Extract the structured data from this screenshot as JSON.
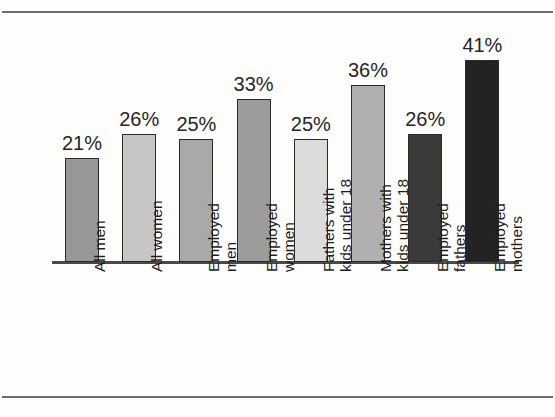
{
  "figure": {
    "background_color": "#fdfdfc",
    "rule_color": "#6d6d6d",
    "axis_color": "#4a4a4a"
  },
  "chart_data": {
    "type": "bar",
    "title": "",
    "subtitle": "",
    "xlabel": "",
    "ylabel": "",
    "ylim": [
      0,
      45
    ],
    "grid": false,
    "legend": "none",
    "value_suffix": "%",
    "categories": [
      "All men",
      "All women",
      "Employed men",
      "Employed women",
      "Fathers with kids under 18",
      "Mothers with kids under 18",
      "Employed fathers",
      "Employed mothers"
    ],
    "values": [
      21,
      26,
      25,
      33,
      25,
      36,
      26,
      41
    ],
    "data_labels": [
      "21%",
      "26%",
      "25%",
      "33%",
      "25%",
      "36%",
      "26%",
      "41%"
    ],
    "bar_colors": [
      "#989898",
      "#c6c6c6",
      "#a9a9a9",
      "#9c9c9c",
      "#dcdcdc",
      "#b0b0b0",
      "#3a3a3a",
      "#232323"
    ],
    "bar_edge_color": "#2a2a2a",
    "tick_labels": [
      {
        "line1": "All men",
        "line2": ""
      },
      {
        "line1": "All women",
        "line2": ""
      },
      {
        "line1": "Employed",
        "line2": "men"
      },
      {
        "line1": "Employed",
        "line2": "women"
      },
      {
        "line1": "Fathers with",
        "line2": "kids under 18"
      },
      {
        "line1": "Mothers with",
        "line2": "kids under 18"
      },
      {
        "line1": "Employed",
        "line2": "fathers"
      },
      {
        "line1": "Employed",
        "line2": "mothers"
      }
    ]
  }
}
